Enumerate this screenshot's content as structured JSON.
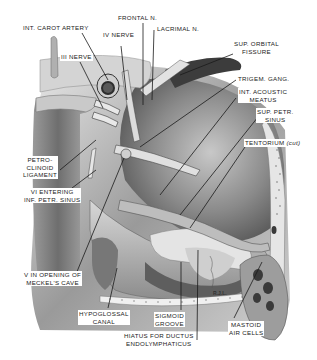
{
  "figure": {
    "signature": "R.J.L."
  },
  "labels": {
    "int_carot_artery": "INT. CAROT ARTERY",
    "iv_nerve": "IV NERVE",
    "frontal_n": "FRONTAL N.",
    "lacrimal_n": "LACRIMAL N.",
    "iii_nerve": "III NERVE",
    "sup_orbital_fissure": [
      "SUP. ORBITAL",
      "FISSURE"
    ],
    "trigem_gang": "TRIGEM. GANG.",
    "int_acoustic_meatus": [
      "INT. ACOUSTIC",
      "MEATUS"
    ],
    "sup_petr_sinus": [
      "SUP. PETR.",
      "SINUS"
    ],
    "tentorium": "TENTORIUM",
    "tentorium_note": "(cut)",
    "petroclinoid_ligament": [
      "PETRO-",
      "CLINOID",
      "LIGAMENT"
    ],
    "vi_entering": [
      "VI ENTERING",
      "INF. PETR. SINUS"
    ],
    "v_opening": [
      "V IN OPENING OF",
      "MECKEL'S CAVE"
    ],
    "hypoglossal_canal": [
      "HYPOGLOSSAL",
      "CANAL"
    ],
    "sigmoid_groove": [
      "SIGMOID",
      "GROOVE"
    ],
    "hiatus": [
      "HIATUS FOR DUCTUS",
      "ENDOLYMPHATICUS"
    ],
    "mastoid_air_cells": [
      "MASTOID",
      "AIR CELLS"
    ]
  },
  "colors": {
    "bone_light": "#d9d9d9",
    "bone_mid": "#a8a8a8",
    "bone_dark": "#4a4a4a",
    "leader": "#1a1a1a"
  }
}
